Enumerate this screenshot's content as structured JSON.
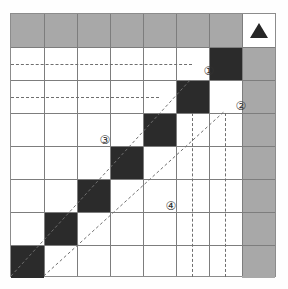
{
  "figure": {
    "type": "matrix-grid-diagram",
    "columns": 8,
    "rows": 8,
    "cell_width": 33,
    "cell_height": 33
  },
  "colors": {
    "header_gray": "#a8a8a8",
    "filled_black": "#2b2b2b",
    "cell_white": "#ffffff",
    "gridline": "#7d7d7d",
    "frame": "#8c8c8c",
    "dashed_guide": "#6f6f6f",
    "label_text": "#333333",
    "background": "#ffffff"
  },
  "labels": [
    {
      "text": "①",
      "name": "callout-1",
      "left": 190,
      "top": 50
    },
    {
      "text": "②",
      "name": "callout-2",
      "left": 222,
      "top": 85
    },
    {
      "text": "③",
      "name": "callout-3",
      "left": 86,
      "top": 119
    },
    {
      "text": "④",
      "name": "callout-4",
      "left": 152,
      "top": 185
    }
  ],
  "marker": {
    "name": "triangle-marker",
    "shape": "triangle-up",
    "color": "#262626",
    "cell_row": 0,
    "cell_col": 7
  },
  "cells": [
    {
      "row": 0,
      "col": 0,
      "shade": "gray"
    },
    {
      "row": 0,
      "col": 1,
      "shade": "gray"
    },
    {
      "row": 0,
      "col": 2,
      "shade": "gray"
    },
    {
      "row": 0,
      "col": 3,
      "shade": "gray"
    },
    {
      "row": 0,
      "col": 4,
      "shade": "gray"
    },
    {
      "row": 0,
      "col": 5,
      "shade": "gray"
    },
    {
      "row": 0,
      "col": 6,
      "shade": "gray"
    },
    {
      "row": 0,
      "col": 7,
      "shade": "white"
    },
    {
      "row": 1,
      "col": 6,
      "shade": "black"
    },
    {
      "row": 1,
      "col": 7,
      "shade": "gray"
    },
    {
      "row": 2,
      "col": 5,
      "shade": "black"
    },
    {
      "row": 2,
      "col": 7,
      "shade": "gray"
    },
    {
      "row": 3,
      "col": 4,
      "shade": "black"
    },
    {
      "row": 3,
      "col": 7,
      "shade": "gray"
    },
    {
      "row": 4,
      "col": 3,
      "shade": "black"
    },
    {
      "row": 4,
      "col": 7,
      "shade": "gray"
    },
    {
      "row": 5,
      "col": 2,
      "shade": "black"
    },
    {
      "row": 5,
      "col": 7,
      "shade": "gray"
    },
    {
      "row": 6,
      "col": 1,
      "shade": "black"
    },
    {
      "row": 6,
      "col": 7,
      "shade": "gray"
    },
    {
      "row": 7,
      "col": 0,
      "shade": "black"
    },
    {
      "row": 7,
      "col": 7,
      "shade": "gray"
    }
  ],
  "dashed_horizontal_lines": [
    {
      "name": "dashed-row-guide-1",
      "top": 50,
      "left": 0,
      "width": 181
    },
    {
      "name": "dashed-row-guide-2",
      "top": 83,
      "left": 0,
      "width": 148
    }
  ],
  "dashed_vertical_lines": [
    {
      "name": "dashed-col-guide-1",
      "left": 181,
      "top": 99,
      "height": 164
    },
    {
      "name": "dashed-col-guide-2",
      "left": 214,
      "top": 99,
      "height": 164
    }
  ],
  "dashed_diagonals": [
    {
      "name": "dashed-diagonal-upper",
      "x1": 0,
      "y1": 264,
      "x2": 181,
      "y2": 66
    },
    {
      "name": "dashed-diagonal-lower",
      "x1": 33,
      "y1": 264,
      "x2": 214,
      "y2": 99
    }
  ]
}
